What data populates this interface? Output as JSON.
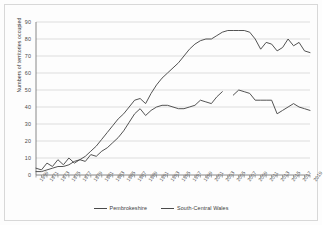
{
  "chart_data": {
    "type": "line",
    "title": "",
    "xlabel": "",
    "ylabel": "Numbers of territories occupied",
    "ylim": [
      0,
      90
    ],
    "ytick_values": [
      0,
      10,
      20,
      30,
      40,
      50,
      60,
      70,
      80,
      90
    ],
    "grid": true,
    "legend_position": "bottom",
    "x": [
      1969,
      1970,
      1971,
      1972,
      1973,
      1974,
      1975,
      1976,
      1977,
      1978,
      1979,
      1980,
      1981,
      1982,
      1983,
      1984,
      1985,
      1986,
      1987,
      1988,
      1989,
      1990,
      1991,
      1992,
      1993,
      1994,
      1995,
      1996,
      1997,
      1998,
      1999,
      2000,
      2001,
      2002,
      2003,
      2004,
      2005,
      2006,
      2007,
      2008,
      2009,
      2010,
      2011,
      2012,
      2013,
      2014,
      2015,
      2016,
      2017,
      2018,
      2019
    ],
    "xtick_labels": [
      "1969",
      "1971",
      "1973",
      "1975",
      "1977",
      "1979",
      "1981",
      "1983",
      "1985",
      "1987",
      "1989",
      "1991",
      "1993",
      "1995",
      "1997",
      "1999",
      "2001",
      "2003",
      "2005",
      "2007",
      "2009",
      "2011",
      "2013",
      "2015",
      "2017",
      "2019"
    ],
    "series": [
      {
        "name": "Pembrokeshire",
        "color": "#4a4a4a",
        "values": [
          2,
          2,
          3,
          4,
          5,
          5,
          6,
          8,
          9,
          11,
          14,
          17,
          21,
          25,
          29,
          33,
          36,
          40,
          44,
          45,
          42,
          48,
          53,
          57,
          60,
          63,
          66,
          70,
          74,
          77,
          79,
          80,
          80,
          82,
          84,
          85,
          85,
          85,
          85,
          84,
          80,
          74,
          78,
          77,
          73,
          75,
          80,
          76,
          78,
          73,
          72
        ]
      },
      {
        "name": "South-Central Wales",
        "color": "#4a4a4a",
        "values": [
          4,
          3,
          7,
          5,
          9,
          6,
          10,
          7,
          9,
          8,
          12,
          11,
          14,
          16,
          19,
          22,
          26,
          31,
          36,
          39,
          35,
          38,
          40,
          41,
          41,
          40,
          39,
          39,
          40,
          41,
          44,
          43,
          42,
          46,
          49,
          null,
          47,
          50,
          49,
          48,
          44,
          44,
          44,
          44,
          36,
          38,
          40,
          42,
          40,
          39,
          38
        ]
      }
    ]
  },
  "legend": {
    "items": [
      {
        "label": "Pembrokeshire"
      },
      {
        "label": "South-Central Wales"
      }
    ]
  }
}
